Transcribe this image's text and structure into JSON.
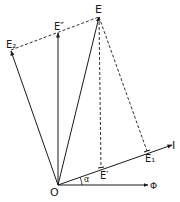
{
  "diagram": {
    "labels": {
      "E": "E",
      "E_double_prime": "E″",
      "E2": "E₂",
      "E1": "E₁",
      "E_prime": "E′",
      "I": "I",
      "O": "O",
      "Phi": "Φ",
      "alpha": "α"
    },
    "stroke_color": "#1a1a1a",
    "background": "#ffffff"
  }
}
